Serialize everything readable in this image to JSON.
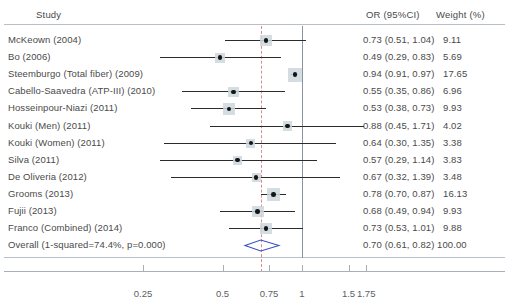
{
  "header": {
    "study_label": "Study",
    "or_label": "OR (95%CI)",
    "weight_label": "Weight (%)"
  },
  "axis": {
    "ticks": [
      {
        "value": 0.25,
        "label": "0.25"
      },
      {
        "value": 0.5,
        "label": "0.5"
      },
      {
        "value": 0.75,
        "label": "0.75"
      },
      {
        "value": 1.0,
        "label": "1"
      },
      {
        "value": 1.5,
        "label": "1.5"
      },
      {
        "value": 1.75,
        "label": "1.75"
      }
    ],
    "null_line": 1.0,
    "pooled_line": 0.7
  },
  "colors": {
    "marker_box": "#ccd7dd",
    "marker_dot": "#141414",
    "ci_line": "#2b2b2b",
    "null_line": "#8a95a0",
    "pooled_line": "#d98d8d",
    "diamond": "#3a4fc4",
    "rule": "#b9bfc6",
    "text": "#4a4a4a"
  },
  "chart_data": {
    "type": "forest",
    "title": "",
    "xlabel": "",
    "ylabel": "",
    "effect_measure": "OR",
    "ci_level": "95%CI",
    "scale": "log",
    "xlim": [
      0.22,
      1.95
    ],
    "null_value": 1.0,
    "grid": false,
    "legend": "none",
    "studies": [
      {
        "label": "McKeown (2004)",
        "or": 0.73,
        "lower": 0.51,
        "upper": 1.04,
        "weight": 9.11,
        "or_text": "0.73 (0.51,  1.04)",
        "weight_text": "9.11"
      },
      {
        "label": "Bo (2006)",
        "or": 0.49,
        "lower": 0.29,
        "upper": 0.83,
        "weight": 5.69,
        "or_text": "0.49 (0.29,  0.83)",
        "weight_text": "5.69"
      },
      {
        "label": "Steemburgo (Total fiber) (2009)",
        "or": 0.94,
        "lower": 0.91,
        "upper": 0.97,
        "weight": 17.65,
        "or_text": "0.94 (0.91,  0.97)",
        "weight_text": "17.65"
      },
      {
        "label": "Cabello-Saavedra (ATP-III) (2010)",
        "or": 0.55,
        "lower": 0.35,
        "upper": 0.86,
        "weight": 6.96,
        "or_text": "0.55 (0.35,  0.86)",
        "weight_text": "6.96"
      },
      {
        "label": "Hosseinpour-Niazi (2011)",
        "or": 0.53,
        "lower": 0.38,
        "upper": 0.73,
        "weight": 9.93,
        "or_text": "0.53 (0.38,  0.73)",
        "weight_text": "9.93"
      },
      {
        "label": "Kouki (Men) (2011)",
        "or": 0.88,
        "lower": 0.45,
        "upper": 1.71,
        "weight": 4.02,
        "or_text": "0.88 (0.45,  1.71)",
        "weight_text": "4.02"
      },
      {
        "label": "Kouki (Women) (2011)",
        "or": 0.64,
        "lower": 0.3,
        "upper": 1.35,
        "weight": 3.38,
        "or_text": "0.64 (0.30,  1.35)",
        "weight_text": "3.38"
      },
      {
        "label": "Silva (2011)",
        "or": 0.57,
        "lower": 0.29,
        "upper": 1.14,
        "weight": 3.83,
        "or_text": "0.57 (0.29,  1.14)",
        "weight_text": "3.83"
      },
      {
        "label": "De Oliveria (2012)",
        "or": 0.67,
        "lower": 0.32,
        "upper": 1.39,
        "weight": 3.48,
        "or_text": "0.67 (0.32,  1.39)",
        "weight_text": "3.48"
      },
      {
        "label": "Grooms (2013)",
        "or": 0.78,
        "lower": 0.7,
        "upper": 0.87,
        "weight": 16.13,
        "or_text": "0.78 (0.70,  0.87)",
        "weight_text": "16.13"
      },
      {
        "label": "Fujii (2013)",
        "or": 0.68,
        "lower": 0.49,
        "upper": 0.94,
        "weight": 9.93,
        "or_text": "0.68 (0.49,  0.94)",
        "weight_text": "9.93"
      },
      {
        "label": "Franco (Combined) (2014)",
        "or": 0.73,
        "lower": 0.53,
        "upper": 1.01,
        "weight": 9.88,
        "or_text": "0.73 (0.53,  1.01)",
        "weight_text": "9.88"
      }
    ],
    "overall": {
      "label": "Overall (1-squared=74.4%, p=0.000)",
      "or": 0.7,
      "lower": 0.61,
      "upper": 0.82,
      "weight": 100.0,
      "or_text": "0.70 (0.61,  0.82)",
      "weight_text": "100.00",
      "heterogeneity_i2": "74.4%",
      "heterogeneity_p": "0.000"
    }
  }
}
